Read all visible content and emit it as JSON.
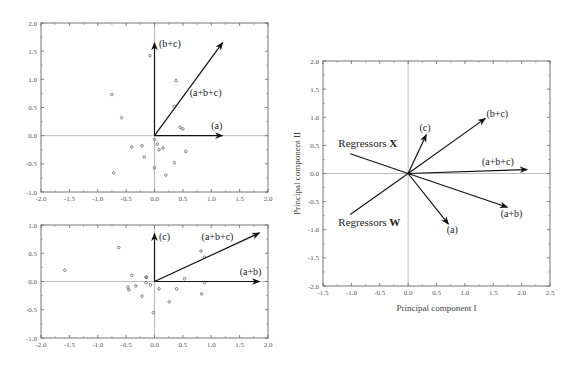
{
  "chart_data": [
    {
      "id": "panel-top-left",
      "type": "scatter",
      "title": "",
      "xlabel": "",
      "ylabel": "",
      "xlim": [
        -2.0,
        2.0
      ],
      "ylim": [
        -1.0,
        2.0
      ],
      "xticks": [
        "-2.0",
        "-1.5",
        "-1.0",
        "-0.5",
        "0.0",
        "0.5",
        "1.0",
        "1.5",
        "2.0"
      ],
      "yticks": [
        "-1.0",
        "-0.5",
        "0.0",
        "0.5",
        "1.0",
        "1.5",
        "2.0"
      ],
      "grid": false,
      "frame_px": {
        "left": 41,
        "right": 268,
        "top": 23,
        "bottom": 192
      },
      "points": [
        [
          -0.08,
          1.42
        ],
        [
          0.38,
          0.98
        ],
        [
          -0.75,
          0.73
        ],
        [
          -0.58,
          0.32
        ],
        [
          0.35,
          0.52
        ],
        [
          0.45,
          0.15
        ],
        [
          0.5,
          0.12
        ],
        [
          0.0,
          -0.07
        ],
        [
          0.05,
          -0.15
        ],
        [
          0.15,
          -0.22
        ],
        [
          0.08,
          -0.25
        ],
        [
          -0.4,
          -0.2
        ],
        [
          -0.22,
          -0.18
        ],
        [
          -0.18,
          -0.38
        ],
        [
          0.55,
          -0.28
        ],
        [
          0.35,
          -0.48
        ],
        [
          0.0,
          -0.57
        ],
        [
          0.2,
          -0.7
        ],
        [
          -0.72,
          -0.66
        ]
      ],
      "vectors": [
        {
          "label": "(b+c)",
          "x": 0.0,
          "y": 1.65,
          "label_x": 0.08,
          "label_y": 1.58,
          "anchor": "start"
        },
        {
          "label": "(a+b+c)",
          "x": 1.2,
          "y": 1.65,
          "label_x": 0.62,
          "label_y": 0.7,
          "anchor": "start"
        },
        {
          "label": "(a)",
          "x": 1.2,
          "y": 0.0,
          "label_x": 1.0,
          "label_y": 0.12,
          "anchor": "start"
        }
      ]
    },
    {
      "id": "panel-bottom-left",
      "type": "scatter",
      "title": "",
      "xlabel": "",
      "ylabel": "",
      "xlim": [
        -2.0,
        2.0
      ],
      "ylim": [
        -1.0,
        1.0
      ],
      "xticks": [
        "-2.0",
        "-1.5",
        "-1.0",
        "-0.5",
        "0.0",
        "0.5",
        "1.0",
        "1.5",
        "2.0"
      ],
      "yticks": [
        "-1.0",
        "-0.5",
        "0.0",
        "0.5",
        "1.0"
      ],
      "grid": false,
      "frame_px": {
        "left": 41,
        "right": 268,
        "top": 225,
        "bottom": 338
      },
      "points": [
        [
          -1.58,
          0.2
        ],
        [
          -0.63,
          0.6
        ],
        [
          -0.4,
          0.11
        ],
        [
          -0.15,
          0.08
        ],
        [
          -0.14,
          0.07
        ],
        [
          -0.15,
          -0.02
        ],
        [
          -0.07,
          -0.06
        ],
        [
          -0.47,
          -0.1
        ],
        [
          -0.45,
          -0.15
        ],
        [
          -0.33,
          -0.08
        ],
        [
          -0.22,
          -0.26
        ],
        [
          -0.02,
          -0.55
        ],
        [
          0.08,
          -0.13
        ],
        [
          0.26,
          -0.36
        ],
        [
          0.39,
          -0.13
        ],
        [
          0.53,
          0.05
        ],
        [
          0.82,
          0.54
        ],
        [
          0.88,
          0.43
        ],
        [
          0.88,
          -0.02
        ],
        [
          0.83,
          -0.22
        ]
      ],
      "vectors": [
        {
          "label": "(c)",
          "x": 0.0,
          "y": 0.85,
          "label_x": 0.08,
          "label_y": 0.74,
          "anchor": "start"
        },
        {
          "label": "(a+b+c)",
          "x": 1.85,
          "y": 0.86,
          "label_x": 0.83,
          "label_y": 0.74,
          "anchor": "start"
        },
        {
          "label": "(a+b)",
          "x": 1.85,
          "y": 0.0,
          "label_x": 1.5,
          "label_y": 0.12,
          "anchor": "start"
        }
      ]
    },
    {
      "id": "panel-right",
      "type": "line",
      "title": "",
      "xlabel": "Principal component  I",
      "ylabel": "Principal component  II",
      "xlim": [
        -1.5,
        2.5
      ],
      "ylim": [
        -2.0,
        2.0
      ],
      "xticks": [
        "-1.5",
        "-1.0",
        "-0.5",
        "0.0",
        "0.5",
        "1.0",
        "1.5",
        "2.0",
        "2.5"
      ],
      "yticks": [
        "-2.0",
        "-1.5",
        "-1.0",
        "-0.5",
        "0.0",
        "0.5",
        "1.0",
        "1.5",
        "2.0"
      ],
      "grid": false,
      "frame_px": {
        "left": 323,
        "right": 550,
        "top": 61,
        "bottom": 286
      },
      "vectors": [
        {
          "label": "(c)",
          "x": 0.32,
          "y": 0.69,
          "label_x": 0.2,
          "label_y": 0.76,
          "anchor": "start"
        },
        {
          "label": "(b+c)",
          "x": 1.36,
          "y": 0.98,
          "label_x": 1.38,
          "label_y": 1.0,
          "anchor": "start"
        },
        {
          "label": "(a+b+c)",
          "x": 2.1,
          "y": 0.07,
          "label_x": 1.3,
          "label_y": 0.15,
          "anchor": "start"
        },
        {
          "label": "(a+b)",
          "x": 1.75,
          "y": -0.6,
          "label_x": 1.63,
          "label_y": -0.77,
          "anchor": "start"
        },
        {
          "label": "(a)",
          "x": 0.71,
          "y": -0.9,
          "label_x": 0.68,
          "label_y": -1.05,
          "anchor": "start"
        }
      ],
      "regressor_lines": [
        {
          "label_text": "Regressors ",
          "label_bold": "X",
          "x": -1.02,
          "y": 0.35,
          "label_x": -1.23,
          "label_y": 0.48
        },
        {
          "label_text": "Regressors ",
          "label_bold": "W",
          "x": -1.02,
          "y": -0.73,
          "label_x": -1.23,
          "label_y": -0.93
        }
      ]
    }
  ]
}
